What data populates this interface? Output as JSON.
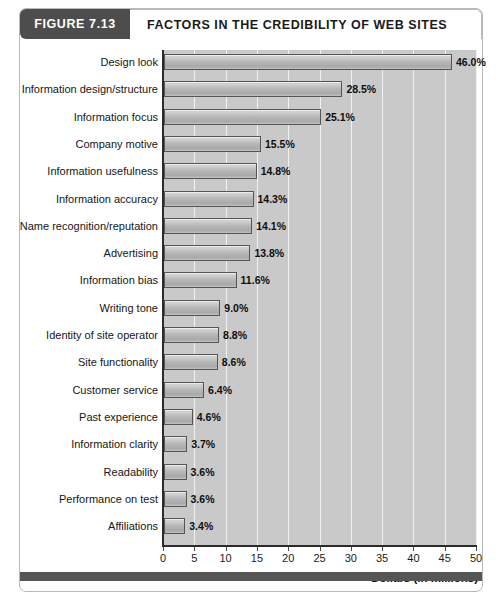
{
  "figure": {
    "number_label": "FIGURE 7.13",
    "title": "FACTORS IN THE CREDIBILITY OF WEB SITES"
  },
  "colors": {
    "header_block": "#4d4d4d",
    "plot_background": "#c9c9c9",
    "gridline": "#f2f2f2",
    "bar_fill": "#b6b6b6",
    "bar_border": "#555555",
    "footer_band": "#565656",
    "frame_border": "#b9b9b9"
  },
  "chart_data": {
    "type": "bar",
    "orientation": "horizontal",
    "title": "FACTORS IN THE CREDIBILITY OF WEB SITES",
    "xlabel": "Dollars (in millions)",
    "ylabel": "",
    "xlim": [
      0,
      50
    ],
    "xticks": [
      0,
      5,
      10,
      15,
      20,
      25,
      30,
      35,
      40,
      45,
      50
    ],
    "xtick_labels": [
      "0",
      "5",
      "10",
      "15",
      "20",
      "25",
      "30",
      "35",
      "40",
      "45",
      "50"
    ],
    "grid": true,
    "legend": "none",
    "categories": [
      "Design look",
      "Information design/structure",
      "Information focus",
      "Company motive",
      "Information usefulness",
      "Information accuracy",
      "Name recognition/reputation",
      "Advertising",
      "Information bias",
      "Writing tone",
      "Identity of site operator",
      "Site functionality",
      "Customer service",
      "Past experience",
      "Information clarity",
      "Readability",
      "Performance on test",
      "Affiliations"
    ],
    "values": [
      46.0,
      28.5,
      25.1,
      15.5,
      14.8,
      14.3,
      14.1,
      13.8,
      11.6,
      9.0,
      8.8,
      8.6,
      6.4,
      4.6,
      3.7,
      3.6,
      3.6,
      3.4
    ],
    "data_labels": [
      "46.0%",
      "28.5%",
      "25.1%",
      "15.5%",
      "14.8%",
      "14.3%",
      "14.1%",
      "13.8%",
      "11.6%",
      "9.0%",
      "8.8%",
      "8.6%",
      "6.4%",
      "4.6%",
      "3.7%",
      "3.6%",
      "3.6%",
      "3.4%"
    ]
  }
}
